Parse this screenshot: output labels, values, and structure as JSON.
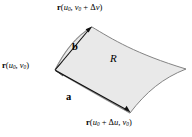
{
  "figure": {
    "name": "curved-surface-patch-with-tangent-vectors",
    "background_color": "#ffffff",
    "patch_fill_color": "#e9e9e9",
    "patch_stroke_color": "#6b6b6b",
    "vector_color": "#1a1a1a",
    "labels": {
      "top_vertex": {
        "vector_symbol": "r",
        "open_paren": "(",
        "arg1_base": "u",
        "arg1_sub": "0",
        "comma": ", ",
        "arg2_base": "v",
        "arg2_sub": "0",
        "plus": " + ",
        "delta": "Δ",
        "delta_var": "v",
        "close_paren": ")"
      },
      "left_vertex": {
        "vector_symbol": "r",
        "open_paren": "(",
        "arg1_base": "u",
        "arg1_sub": "0",
        "comma": ", ",
        "arg2_base": "v",
        "arg2_sub": "0",
        "close_paren": ")"
      },
      "bottom_right_vertex": {
        "vector_symbol": "r",
        "open_paren": "(",
        "arg1_base": "u",
        "arg1_sub": "0",
        "plus": " + ",
        "delta": "Δ",
        "delta_var": "u",
        "comma": ", ",
        "arg2_base": "v",
        "arg2_sub": "0",
        "close_paren": ")"
      },
      "region": "R",
      "vector_a": "a",
      "vector_b": "b"
    }
  }
}
